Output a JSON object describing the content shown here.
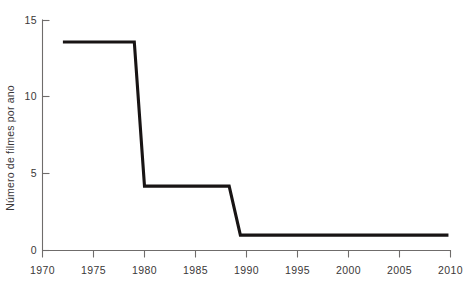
{
  "chart_data": {
    "type": "line",
    "title": "",
    "subtitle": "",
    "xlabel": "",
    "ylabel": "Número de filmes por ano",
    "xlim": [
      1970,
      2010
    ],
    "ylim": [
      0,
      15
    ],
    "grid": false,
    "legend": false,
    "legend_position": "none",
    "line_color": "#181414",
    "axis_color": "#6f6c6b",
    "xticks": [
      1970,
      1975,
      1980,
      1985,
      1990,
      1995,
      2000,
      2005,
      2010
    ],
    "xtick_labels": [
      "1970",
      "1975",
      "1980",
      "1985",
      "1990",
      "1995",
      "2000",
      "2005",
      "2010"
    ],
    "yticks": [
      0,
      5,
      10,
      15
    ],
    "ytick_labels": [
      "0",
      "5",
      "10",
      "15"
    ],
    "series": [
      {
        "name": "Número de filmes por ano",
        "x": [
          1972.0,
          1979.0,
          1980.0,
          1988.3,
          1989.4,
          2009.8
        ],
        "values": [
          13.6,
          13.6,
          4.2,
          4.2,
          1.0,
          1.0
        ]
      }
    ],
    "annotations": []
  },
  "axis": {
    "y_title": "Número de filmes por ano",
    "y_labels": {
      "t15": "15",
      "t10": "10",
      "t5": "5",
      "t0": "0"
    },
    "x_labels": {
      "t1970": "1970",
      "t1975": "1975",
      "t1980": "1980",
      "t1985": "1985",
      "t1990": "1990",
      "t1995": "1995",
      "t2000": "2000",
      "t2005": "2005",
      "t2010": "2010"
    }
  }
}
